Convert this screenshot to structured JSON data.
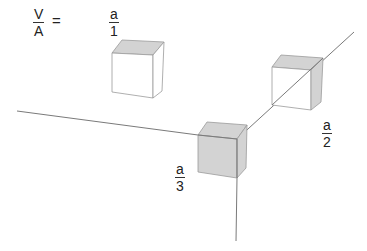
{
  "formula": {
    "lhs_numerator": "V",
    "lhs_denominator": "A",
    "equals": "="
  },
  "labels": [
    {
      "numerator": "a",
      "denominator": "1"
    },
    {
      "numerator": "a",
      "denominator": "2"
    },
    {
      "numerator": "a",
      "denominator": "3"
    }
  ],
  "colors": {
    "line": "#7a7a7a",
    "shade": "#d3d3d3",
    "face_white": "#ffffff",
    "edge": "#9a9a9a"
  }
}
